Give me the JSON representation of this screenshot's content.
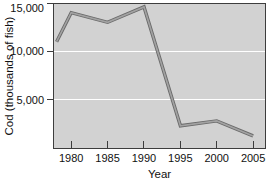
{
  "chart_data": {
    "type": "line",
    "title": "",
    "xlabel": "Year",
    "ylabel": "Cod (thousands of fish)",
    "x": [
      1978,
      1980,
      1985,
      1990,
      1995,
      2000,
      2005
    ],
    "values": [
      11000,
      14000,
      13000,
      14600,
      2300,
      2800,
      1250
    ],
    "x_ticks": [
      1980,
      1985,
      1990,
      1995,
      2000,
      2005
    ],
    "x_tick_labels": [
      "1980",
      "1985",
      "1990",
      "1995",
      "2000",
      "2005"
    ],
    "y_ticks": [
      5000,
      10000,
      15000
    ],
    "y_tick_labels": [
      "5,000",
      "10,000",
      "15,000"
    ],
    "xlim": [
      1977.5,
      2006.7
    ],
    "ylim": [
      0,
      15000
    ],
    "grid": "horizontal",
    "legend": null
  },
  "style": {
    "page_bg": "#ffffff",
    "plot_bg": "#d2d2d2",
    "grid_color": "#ffffff",
    "axis_color": "#3d3d3d",
    "text_color": "#111111",
    "line_outer": "#6a6a6a",
    "line_inner": "#a2a2a2"
  }
}
